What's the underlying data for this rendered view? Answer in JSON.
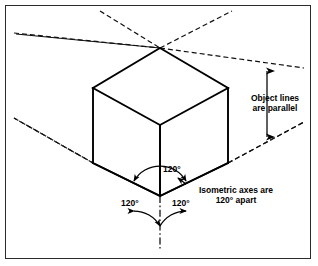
{
  "figure": {
    "kind": "isometric-projection-diagram",
    "background_color": "#ffffff",
    "line_color": "#000000",
    "border_color": "#2b2b2b"
  },
  "annotations": {
    "parallel_note_line1": "Object lines",
    "parallel_note_line2": "are parallel",
    "axes_note_line1": "Isometric axes are",
    "axes_note_line2": "120° apart",
    "angle_top": "120°",
    "angle_left": "120°",
    "angle_right": "120°"
  },
  "geometry": {
    "vertex_origin": {
      "x": 160,
      "y": 196
    },
    "cube_vertices": {
      "top": {
        "x": 160,
        "y": 48
      },
      "left_top": {
        "x": 93,
        "y": 88
      },
      "right_top": {
        "x": 228,
        "y": 88
      },
      "center_middle": {
        "x": 160,
        "y": 125
      },
      "left_bottom": {
        "x": 93,
        "y": 163
      },
      "right_bottom": {
        "x": 228,
        "y": 163
      },
      "front_bottom": {
        "x": 160,
        "y": 196
      }
    },
    "axis_angles_degrees": [
      90,
      210,
      330
    ],
    "angle_between_axes_degrees": 120,
    "dimension_arrow": {
      "x": 267,
      "y_top": 68,
      "y_bottom": 140
    }
  }
}
